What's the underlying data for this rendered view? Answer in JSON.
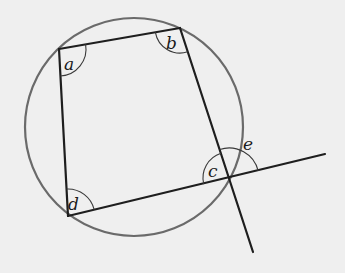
{
  "diagram": {
    "shape": "cyclic-quadrilateral-inscribed-in-circle",
    "vertices": [
      "a",
      "b",
      "c",
      "d"
    ],
    "angle_labels": {
      "a": "a",
      "b": "b",
      "c": "c",
      "d": "d",
      "e": "e"
    },
    "exterior_angle": {
      "label": "e",
      "at_vertex": "c",
      "formed_by": [
        "extension of side dc",
        "side bc extended"
      ]
    },
    "colors": {
      "background": "#efefef",
      "circle": "#6a6a6a",
      "lines": "#1e1e1e"
    }
  }
}
